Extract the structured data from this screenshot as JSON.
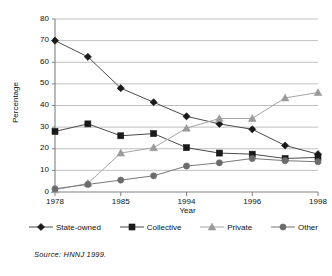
{
  "chart_data": {
    "type": "line",
    "title": "",
    "xlabel": "Year",
    "ylabel": "Percentage",
    "ylim": [
      0,
      80
    ],
    "ytick_values": [
      0,
      10,
      20,
      30,
      40,
      50,
      60,
      70,
      80
    ],
    "ytick_labels": [
      "0",
      "10",
      "20",
      "30",
      "40",
      "50",
      "60",
      "70",
      "80"
    ],
    "grid": "horizontal",
    "legend_position": "below-axis",
    "x": [
      1978,
      1981,
      1985,
      1988,
      1994,
      1995,
      1996,
      1997,
      1998
    ],
    "xtick_labels": [
      "1978",
      "1985",
      "1994",
      "1996",
      "1998"
    ],
    "xtick_values": [
      1978,
      1985,
      1994,
      1996,
      1998
    ],
    "series": [
      {
        "name": "State-owned",
        "marker": "diamond",
        "color": "#1a1a1a",
        "values": [
          70,
          62.5,
          48,
          41.5,
          35,
          31.5,
          29,
          21.5,
          17.5
        ]
      },
      {
        "name": "Collective",
        "marker": "square",
        "color": "#1a1a1a",
        "values": [
          28,
          31.5,
          26,
          27,
          20.5,
          18,
          17.5,
          15.5,
          16
        ]
      },
      {
        "name": "Private",
        "marker": "triangle",
        "color": "#9a9a9a",
        "values": [
          1,
          4,
          18,
          20.5,
          29.5,
          34,
          34,
          43.5,
          46
        ]
      },
      {
        "name": "Other",
        "marker": "circle",
        "color": "#6b6b6b",
        "values": [
          1.5,
          3.5,
          5.5,
          7.5,
          12,
          13.5,
          15.5,
          14.5,
          14
        ]
      }
    ]
  },
  "legend": {
    "items": [
      {
        "label": "State-owned"
      },
      {
        "label": "Collective"
      },
      {
        "label": "Private"
      },
      {
        "label": "Other"
      }
    ]
  },
  "source_note": "Source:  HNNJ 1999.",
  "colors": {
    "axis": "#808080",
    "grid": "#b0b0b0",
    "dark_marker": "#1a1a1a",
    "gray_marker": "#9a9a9a",
    "circle_marker": "#6b6b6b",
    "line": "#555555",
    "background": "#ffffff"
  }
}
